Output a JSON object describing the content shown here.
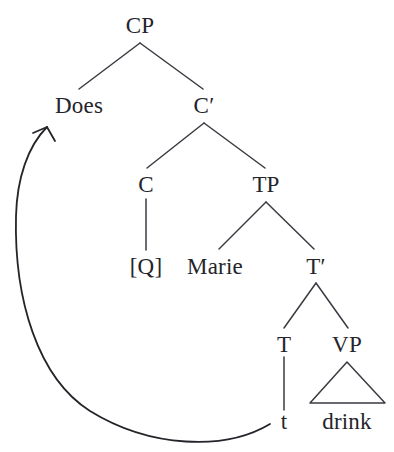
{
  "diagram": {
    "type": "syntax-tree",
    "width": 394,
    "height": 452,
    "background_color": "#ffffff",
    "ink_color": "#24242a",
    "line_color": "#3a3a42",
    "nodes": [
      {
        "id": "cp",
        "label": "CP",
        "x": 140,
        "y": 25
      },
      {
        "id": "does",
        "label": "Does",
        "x": 79,
        "y": 105
      },
      {
        "id": "cbar",
        "label": "C′",
        "x": 204,
        "y": 105
      },
      {
        "id": "c",
        "label": "C",
        "x": 146,
        "y": 184
      },
      {
        "id": "tp",
        "label": "TP",
        "x": 266,
        "y": 184
      },
      {
        "id": "q",
        "label": "[Q]",
        "x": 146,
        "y": 266
      },
      {
        "id": "marie",
        "label": "Marie",
        "x": 215,
        "y": 266
      },
      {
        "id": "tbar",
        "label": "T′",
        "x": 316,
        "y": 266
      },
      {
        "id": "t",
        "label": "T",
        "x": 284,
        "y": 344
      },
      {
        "id": "vp",
        "label": "VP",
        "x": 347,
        "y": 344
      },
      {
        "id": "trace",
        "label": "t",
        "x": 284,
        "y": 421
      },
      {
        "id": "drink",
        "label": "drink",
        "x": 347,
        "y": 421
      }
    ],
    "edges": [
      {
        "from": "cp",
        "to": "does",
        "kind": "branch"
      },
      {
        "from": "cp",
        "to": "cbar",
        "kind": "branch"
      },
      {
        "from": "cbar",
        "to": "c",
        "kind": "branch"
      },
      {
        "from": "cbar",
        "to": "tp",
        "kind": "branch"
      },
      {
        "from": "c",
        "to": "q",
        "kind": "stem"
      },
      {
        "from": "tp",
        "to": "marie",
        "kind": "branch"
      },
      {
        "from": "tp",
        "to": "tbar",
        "kind": "branch"
      },
      {
        "from": "tbar",
        "to": "t",
        "kind": "branch"
      },
      {
        "from": "tbar",
        "to": "vp",
        "kind": "branch"
      },
      {
        "from": "t",
        "to": "trace",
        "kind": "stem"
      },
      {
        "from": "vp",
        "to": "drink",
        "kind": "triangle"
      }
    ],
    "movement_arrow": {
      "from_node": "trace",
      "to_node": "does",
      "description": "curved arrow from trace t to Does"
    }
  }
}
